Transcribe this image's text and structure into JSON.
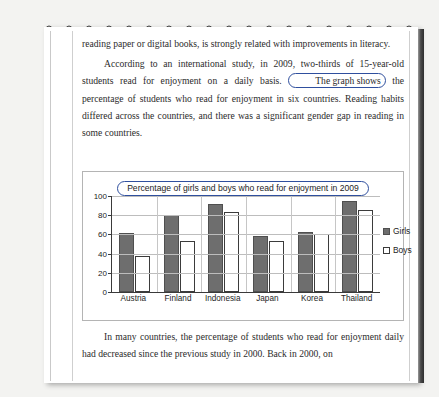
{
  "document": {
    "paragraphs": [
      {
        "id": "para-1",
        "text": "reading paper or digital books, is strongly related with improvements in literacy."
      },
      {
        "id": "para-2-part-a",
        "text": "According to an international study, in 2009, two-thirds of 15-year-old students read for enjoyment on a daily basis."
      },
      {
        "id": "para-2-highlight",
        "text": "The graph shows"
      },
      {
        "id": "para-2-part-b",
        "text": "the percentage of students who read for enjoyment in six countries.   Reading habits differed across the countries, and there was a significant gender gap in reading in some countries."
      },
      {
        "id": "para-3",
        "text": "In many countries, the percentage of students who read for enjoyment daily had decreased since the previous study in 2000.   Back in 2000, on"
      }
    ]
  },
  "chart_data": {
    "type": "bar",
    "title": "Percentage of girls and boys who read for enjoyment in 2009",
    "xlabel": "",
    "ylabel": "",
    "ylim": [
      0,
      100
    ],
    "yticks": [
      0,
      20,
      40,
      60,
      80,
      100
    ],
    "grid": true,
    "legend_position": "right",
    "categories": [
      "Austria",
      "Finland",
      "Indonesia",
      "Japan",
      "Korea",
      "Thailand"
    ],
    "series": [
      {
        "name": "Girls",
        "color": "#6e6e6e",
        "values": [
          61,
          80,
          92,
          58,
          62,
          95
        ]
      },
      {
        "name": "Boys",
        "color": "#ffffff",
        "values": [
          38,
          53,
          83,
          53,
          60,
          85
        ]
      }
    ]
  },
  "annotations": {
    "highlight_color": "#2f4f9e"
  }
}
